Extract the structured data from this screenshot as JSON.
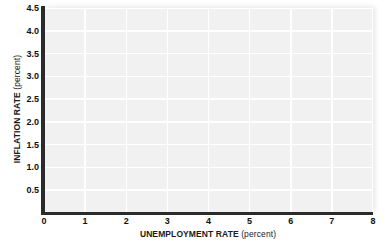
{
  "chart_data": {
    "type": "scatter",
    "title": "",
    "subtitle": "",
    "xlabel_main": "UNEMPLOYMENT RATE",
    "xlabel_unit": "(percent)",
    "ylabel_main": "INFLATION RATE",
    "ylabel_unit": "(percent)",
    "xlim": [
      0,
      8
    ],
    "ylim": [
      0,
      4.5
    ],
    "xticks": [
      0,
      1,
      2,
      3,
      4,
      5,
      6,
      7,
      8
    ],
    "xtick_labels": [
      "0",
      "1",
      "2",
      "3",
      "4",
      "5",
      "6",
      "7",
      "8"
    ],
    "yticks": [
      0.5,
      1.0,
      1.5,
      2.0,
      2.5,
      3.0,
      3.5,
      4.0,
      4.5
    ],
    "ytick_labels": [
      "0.5",
      "1.0",
      "1.5",
      "2.0",
      "2.5",
      "3.0",
      "3.5",
      "4.0",
      "4.5"
    ],
    "origin_label": "0",
    "series": [],
    "values": [],
    "grid": true,
    "grid_color": "#ffffff",
    "plot_background": "#f1f1f1",
    "axis_color": "#2b2b2b",
    "page_background": "#ffffff",
    "legend": null,
    "annotations": []
  }
}
